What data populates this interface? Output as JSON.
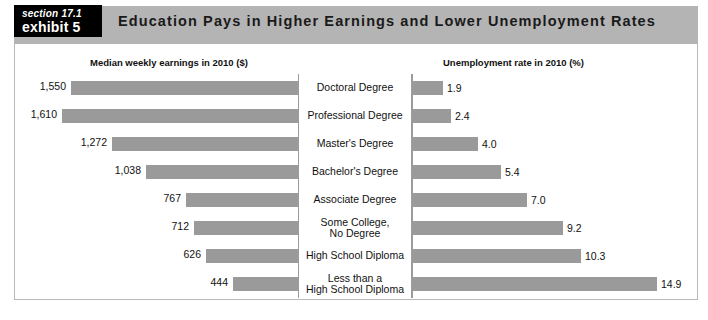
{
  "badge": {
    "section": "section 17.1",
    "exhibit": "exhibit 5"
  },
  "header": {
    "title": "Education Pays in Higher Earnings and Lower Unemployment Rates",
    "band_color": "#b4b4b4",
    "badge_bg": "#000000"
  },
  "chart_data": {
    "type": "bar",
    "title": "Education Pays in Higher Earnings and Lower Unemployment Rates",
    "orientation": "horizontal",
    "layout": "back-to-back paired bars with centered category labels",
    "bar_color": "#9a9a9a",
    "grid": false,
    "legend": "none",
    "categories": [
      "Doctoral Degree",
      "Professional Degree",
      "Master's Degree",
      "Bachelor's Degree",
      "Associate Degree",
      "Some College,\nNo Degree",
      "High School Diploma",
      "Less than a\nHigh School Diploma"
    ],
    "series": [
      {
        "name": "Median weekly earnings in 2010 ($)",
        "header": "Median weekly earnings in 2010 ($)",
        "side": "left",
        "unit": "$",
        "xlabel": "Median weekly earnings in 2010 ($)",
        "xlim": [
          0,
          1610
        ],
        "values": [
          1550,
          1610,
          1272,
          1038,
          767,
          712,
          626,
          444
        ],
        "labels": [
          "1,550",
          "1,610",
          "1,272",
          "1,038",
          "767",
          "712",
          "626",
          "444"
        ]
      },
      {
        "name": "Unemployment rate in 2010 (%)",
        "header": "Unemployment rate in 2010 (%)",
        "side": "right",
        "unit": "%",
        "xlabel": "Unemployment rate in 2010 (%)",
        "xlim": [
          0,
          14.9
        ],
        "values": [
          1.9,
          2.4,
          4.0,
          5.4,
          7.0,
          9.2,
          10.3,
          14.9
        ],
        "labels": [
          "1.9",
          "2.4",
          "4.0",
          "5.4",
          "7.0",
          "9.2",
          "10.3",
          "14.9"
        ]
      }
    ]
  }
}
